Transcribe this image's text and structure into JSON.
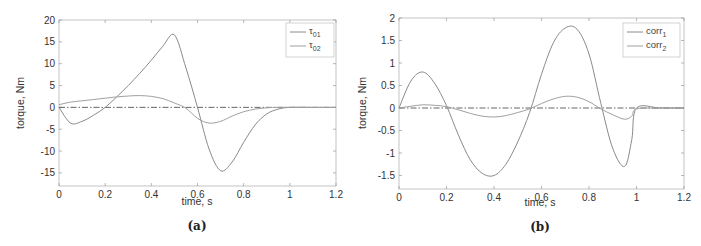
{
  "chart_data": [
    {
      "type": "line",
      "panel": "(a)",
      "title": "",
      "xlabel": "time, s",
      "ylabel": "torque, Nm",
      "xlim": [
        0,
        1.2
      ],
      "ylim": [
        -18,
        20
      ],
      "xticks": [
        "0",
        "0.2",
        "0.4",
        "0.6",
        "0.8",
        "1",
        "1.2"
      ],
      "yticks": [
        "-15",
        "-10",
        "-5",
        "0",
        "5",
        "10",
        "15",
        "20"
      ],
      "grid": false,
      "legend_position": "upper right",
      "x": [
        0,
        0.05,
        0.1,
        0.15,
        0.2,
        0.25,
        0.3,
        0.35,
        0.4,
        0.45,
        0.5,
        0.55,
        0.6,
        0.65,
        0.7,
        0.75,
        0.8,
        0.85,
        0.9,
        0.95,
        1.0,
        1.1,
        1.2
      ],
      "series": [
        {
          "name": "τ01",
          "label_main": "τ",
          "label_sub": "01",
          "color": "#8a8a8a",
          "values": [
            0,
            -3.6,
            -3.2,
            -1.8,
            0,
            2.4,
            5.0,
            7.8,
            10.8,
            14.0,
            16.6,
            9.0,
            0,
            -9.5,
            -14.5,
            -12.5,
            -8.0,
            -4.0,
            -1.5,
            -0.4,
            0,
            0,
            0
          ]
        },
        {
          "name": "τ02",
          "label_main": "τ",
          "label_sub": "02",
          "color": "#a0a0a0",
          "values": [
            0.6,
            1.2,
            1.5,
            1.8,
            2.1,
            2.4,
            2.6,
            2.7,
            2.5,
            2.0,
            1.0,
            -0.2,
            -2.5,
            -3.6,
            -3.2,
            -2.0,
            -1.0,
            -0.4,
            -0.1,
            0,
            0,
            0,
            0
          ]
        }
      ],
      "reference_line": {
        "y": 0,
        "style": "dash-dot"
      }
    },
    {
      "type": "line",
      "panel": "(b)",
      "title": "",
      "xlabel": "time, s",
      "ylabel": "torque, Nm",
      "xlim": [
        0,
        1.2
      ],
      "ylim": [
        -1.8,
        2
      ],
      "xticks": [
        "0",
        "0.2",
        "0.4",
        "0.6",
        "0.8",
        "1",
        "1.2"
      ],
      "yticks": [
        "-1.5",
        "-1",
        "-0.5",
        "0",
        "0.5",
        "1",
        "1.5",
        "2"
      ],
      "grid": false,
      "legend_position": "upper right",
      "x": [
        0,
        0.05,
        0.1,
        0.15,
        0.2,
        0.25,
        0.3,
        0.35,
        0.4,
        0.45,
        0.5,
        0.55,
        0.6,
        0.65,
        0.7,
        0.75,
        0.8,
        0.85,
        0.9,
        0.95,
        0.98,
        1.0,
        1.1,
        1.2
      ],
      "series": [
        {
          "name": "corr1",
          "label_main": "corr",
          "label_sub": "1",
          "color": "#8a8a8a",
          "values": [
            0,
            0.6,
            0.8,
            0.55,
            0.05,
            -0.6,
            -1.15,
            -1.45,
            -1.5,
            -1.25,
            -0.75,
            -0.1,
            0.75,
            1.45,
            1.78,
            1.75,
            1.2,
            0.1,
            -0.9,
            -1.3,
            -0.7,
            0,
            0,
            0
          ]
        },
        {
          "name": "corr2",
          "label_main": "corr",
          "label_sub": "2",
          "color": "#a0a0a0",
          "values": [
            0,
            0.04,
            0.07,
            0.06,
            0.03,
            -0.04,
            -0.12,
            -0.18,
            -0.2,
            -0.17,
            -0.1,
            -0.02,
            0.1,
            0.2,
            0.26,
            0.24,
            0.14,
            -0.02,
            -0.15,
            -0.25,
            -0.18,
            -0.02,
            0,
            0
          ]
        }
      ],
      "reference_line": {
        "y": 0,
        "style": "dash-dot"
      }
    }
  ],
  "captions": {
    "a": "(a)",
    "b": "(b)"
  },
  "axes": {
    "xlabel": "time, s",
    "ylabel": "torque, Nm"
  }
}
